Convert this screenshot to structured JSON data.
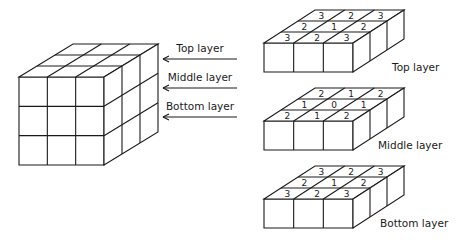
{
  "figure": {
    "arrows": [
      {
        "label": "Top layer"
      },
      {
        "label": "Middle layer"
      },
      {
        "label": "Bottom layer"
      }
    ],
    "layers": [
      {
        "caption": "Top layer",
        "grid": [
          [
            "3",
            "2",
            "3"
          ],
          [
            "2",
            "1",
            "2"
          ],
          [
            "3",
            "2",
            "3"
          ]
        ]
      },
      {
        "caption": "Middle layer",
        "grid": [
          [
            "2",
            "1",
            "2"
          ],
          [
            "1",
            "0",
            "1"
          ],
          [
            "2",
            "1",
            "2"
          ]
        ]
      },
      {
        "caption": "Bottom layer",
        "grid": [
          [
            "3",
            "2",
            "3"
          ],
          [
            "2",
            "1",
            "2"
          ],
          [
            "3",
            "2",
            "3"
          ]
        ]
      }
    ]
  },
  "colors": {
    "line": "#1a1a1a",
    "background": "#ffffff"
  }
}
